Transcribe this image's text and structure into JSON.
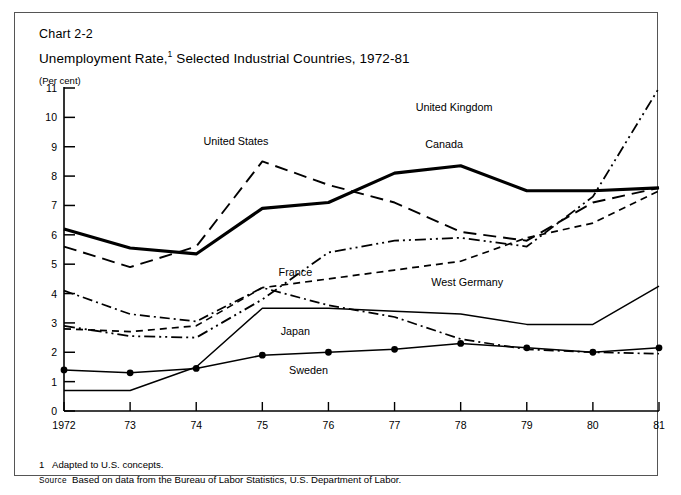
{
  "header": {
    "chart_number": "Chart 2-2",
    "title": "Unemployment Rate,",
    "title_footnote_marker": "1",
    "title_rest": " Selected Industrial Countries, 1972-81",
    "unit_label": "(Per cent)"
  },
  "footnotes": {
    "note_number": "1",
    "note_text": "Adapted to U.S. concepts.",
    "source_label": "Source",
    "source_text": "Based on data from the Bureau of Labor Statistics, U.S. Department of Labor."
  },
  "chart_data": {
    "type": "line",
    "xlabel": "",
    "ylabel": "(Per cent)",
    "x": [
      1972,
      1973,
      1974,
      1975,
      1976,
      1977,
      1978,
      1979,
      1980,
      1981
    ],
    "x_tick_labels": [
      "1972",
      "73",
      "74",
      "75",
      "76",
      "77",
      "78",
      "79",
      "80",
      "81"
    ],
    "y_tick_labels": [
      "0",
      "1",
      "2",
      "3",
      "4",
      "5",
      "6",
      "7",
      "8",
      "9",
      "10",
      "11"
    ],
    "ylim": [
      0,
      11
    ],
    "grid": false,
    "legend": "inline-annotations",
    "series": [
      {
        "name": "Canada",
        "style": "solid-thick",
        "label_x": 1977.75,
        "label_y": 8.95,
        "values": [
          6.2,
          5.55,
          5.35,
          6.9,
          7.1,
          8.1,
          8.35,
          7.5,
          7.5,
          7.6
        ]
      },
      {
        "name": "United States",
        "style": "long-dash",
        "label_x": 1974.6,
        "label_y": 9.05,
        "values": [
          5.6,
          4.9,
          5.6,
          8.5,
          7.7,
          7.1,
          6.1,
          5.8,
          7.1,
          7.6
        ]
      },
      {
        "name": "United Kingdom",
        "style": "dash-dot-dot",
        "label_x": 1977.9,
        "label_y": 10.2,
        "values": [
          2.9,
          2.55,
          2.5,
          3.8,
          5.4,
          5.8,
          5.9,
          5.6,
          7.3,
          11.0
        ]
      },
      {
        "name": "France",
        "style": "short-dash",
        "label_x": 1975.5,
        "label_y": 4.6,
        "values": [
          2.8,
          2.7,
          2.9,
          4.2,
          4.5,
          4.8,
          5.1,
          5.9,
          6.4,
          7.5
        ]
      },
      {
        "name": "West Germany",
        "style": "solid-thin",
        "label_x": 1978.1,
        "label_y": 4.25,
        "values": [
          0.7,
          0.7,
          1.5,
          3.5,
          3.5,
          3.4,
          3.3,
          2.95,
          2.95,
          4.25
        ]
      },
      {
        "name": "Japan",
        "style": "solid-dots",
        "label_x": 1975.5,
        "label_y": 2.6,
        "values": [
          1.4,
          1.3,
          1.45,
          1.9,
          2.0,
          2.1,
          2.3,
          2.15,
          2.0,
          2.15
        ]
      },
      {
        "name": "Sweden",
        "style": "dash-dot",
        "label_x": 1975.7,
        "label_y": 1.25,
        "values": [
          4.1,
          3.3,
          3.05,
          4.2,
          3.6,
          3.2,
          2.45,
          2.1,
          2.0,
          1.95
        ]
      }
    ]
  },
  "axis_geometry": {
    "x0": 64,
    "x1": 659,
    "y0": 411,
    "y1": 88
  }
}
